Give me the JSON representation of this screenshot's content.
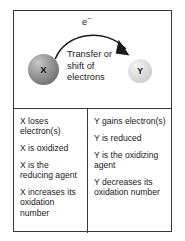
{
  "figure": {
    "border_color": "#3a3a3a",
    "background_color": "#ffffff"
  },
  "diagram": {
    "electron_label": "e",
    "electron_charge": "−",
    "transfer_text": "Transfer or shift of electrons",
    "arrow": {
      "name": "curved-electron-transfer-arrow",
      "direction": "left-to-right",
      "color": "#1a1a1a"
    },
    "species": [
      {
        "symbol": "X",
        "role": "electron donor",
        "color": "#8c8c8c",
        "size": "large"
      },
      {
        "symbol": "Y",
        "role": "electron acceptor",
        "color": "#d4d4d4",
        "size": "small"
      }
    ]
  },
  "statements": {
    "left": {
      "species": "X",
      "items": [
        "X loses electron(s)",
        "X is oxidized",
        "X is the reducing agent",
        "X increases its oxidation number"
      ]
    },
    "right": {
      "species": "Y",
      "items": [
        "Y gains electron(s)",
        "Y is reduced",
        "Y is the oxidizing agent",
        "Y decreases its oxidation number"
      ]
    }
  }
}
